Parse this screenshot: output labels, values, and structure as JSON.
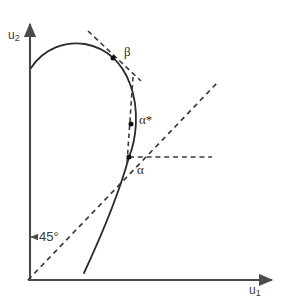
{
  "figure": {
    "background_color": "#ffffff",
    "stroke_color": "#333333",
    "dash_color": "#3a3a3a",
    "point_color": "#111111"
  },
  "axes": {
    "x_label": "u",
    "x_label_sub": "1",
    "y_label": "u",
    "y_label_sub": "2",
    "origin": {
      "x": 28,
      "y": 280
    },
    "x_axis_end": {
      "x": 278,
      "y": 280
    },
    "y_axis_end": {
      "x": 30,
      "y": 18
    }
  },
  "annotations": {
    "angle_label": "45°",
    "angle_leader": "←"
  },
  "points": [
    {
      "name": "beta",
      "label": "β",
      "x": 113,
      "y": 58,
      "label_x": 124,
      "label_y": 44
    },
    {
      "name": "alpha-star",
      "label": "α*",
      "x": 131,
      "y": 124,
      "label_x": 139,
      "label_y": 112
    },
    {
      "name": "alpha",
      "label": "α",
      "x": 129,
      "y": 157,
      "label_x": 137,
      "label_y": 162
    }
  ],
  "chart_data": {
    "type": "line",
    "title": "",
    "xlabel": "u_1",
    "ylabel": "u_2",
    "grid": false,
    "legend": null,
    "annotations": [
      "45°",
      "β",
      "α*",
      "α"
    ],
    "series": [
      {
        "name": "frontier-curve",
        "style": "solid",
        "path": "M 31 68 C 44 48, 66 41, 85 44 C 106 48, 122 62, 130 84 C 140 110, 136 140, 129 157 C 120 190, 104 230, 84 273"
      },
      {
        "name": "forty-five-degree-line",
        "style": "dashed",
        "path": "M 28 280 L 218 82"
      },
      {
        "name": "tangent-at-beta",
        "style": "dashed",
        "path": "M 88 31 L 141 81"
      },
      {
        "name": "tangent-at-alpha-star",
        "style": "dashed",
        "path": "M 133 77 L 127 163"
      },
      {
        "name": "horizontal-guide-at-alpha",
        "style": "dashed",
        "path": "M 129 157 L 212 157"
      },
      {
        "name": "angle-leader-line",
        "style": "solid",
        "path": "M 30 237 L 36 237"
      }
    ]
  }
}
